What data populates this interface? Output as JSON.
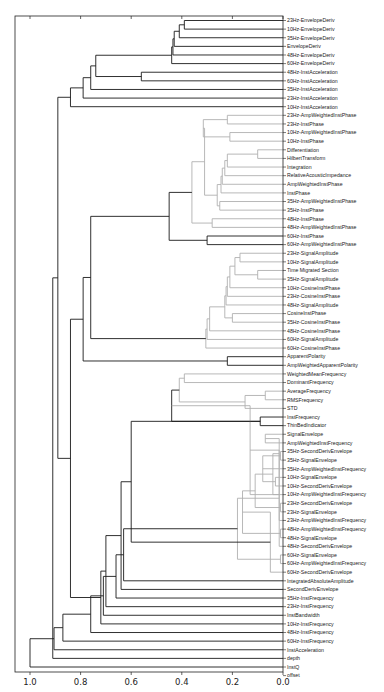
{
  "chart_data": {
    "type": "dendrogram",
    "orientation": "left",
    "title": "",
    "xlabel": "",
    "ylabel": "",
    "xlim": [
      1.05,
      0.0
    ],
    "x_ticks": [
      "1.0",
      "0.8",
      "0.6",
      "0.4",
      "0.2",
      "0.0"
    ],
    "x_tick_values": [
      1.0,
      0.8,
      0.6,
      0.4,
      0.2,
      0.0
    ],
    "colors": {
      "primary": "#1a1a1a",
      "secondary": "#b0b0b0"
    },
    "leaves": [
      "23Hz-EnvelopeDeriv",
      "10Hz-EnvelopeDeriv",
      "35Hz-EnvelopeDeriv",
      "EnvelopeDeriv",
      "48Hz-EnvelopeDeriv",
      "60Hz-EnvelopeDeriv",
      "48Hz-InstAcceleration",
      "60Hz-InstAcceleration",
      "35Hz-InstAcceleration",
      "23Hz-InstAcceleration",
      "10Hz-InstAcceleration",
      "23Hz-AmpWeightedInstPhase",
      "23Hz-InstPhase",
      "10Hz-AmpWeightedInstPhase",
      "10Hz-InstPhase",
      "Differentiation",
      "HilbertTransform",
      "Integration",
      "RelativeAcousticImpedance",
      "AmpWeightedInstPhase",
      "InstPhase",
      "35Hz-AmpWeightedInstPhase",
      "35Hz-InstPhase",
      "48Hz-InstPhase",
      "48Hz-AmpWeightedInstPhase",
      "60Hz-InstPhase",
      "60Hz-AmpWeightedInstPhase",
      "23Hz-SignalAmplitude",
      "10Hz-SignalAmplitude",
      "Time Migrated Section",
      "35Hz-SignalAmplitude",
      "10Hz-CosineInstPhase",
      "23Hz-CosineInstPhase",
      "48Hz-SignalAmplitude",
      "CosineInstPhase",
      "35Hz-CosineInstPhase",
      "48Hz-CosineInstPhase",
      "60Hz-SignalAmplitude",
      "60Hz-CosineInstPhase",
      "ApparentPolarity",
      "AmpWeightedApparentPolarity",
      "WeightedMeanFrequency",
      "DominantFrequency",
      "AverageFrequency",
      "RMSFrequency",
      "STD",
      "InstFrequency",
      "ThinBedIndicator",
      "SignalEnvelope",
      "AmpWeightedInstFrequency",
      "35Hz-SecondDerivEnvelope",
      "35Hz-SignalEnvelope",
      "35Hz-AmpWeightedInstFrequency",
      "10Hz-SignalEnvelope",
      "10Hz-SecondDerivEnvelope",
      "10Hz-AmpWeightedInstFrequency",
      "23Hz-SecondDerivEnvelope",
      "23Hz-SignalEnvelope",
      "23Hz-AmpWeightedInstFrequency",
      "48Hz-AmpWeightedInstFrequency",
      "48Hz-SignalEnvelope",
      "48Hz-SecondDerivEnvelope",
      "60Hz-SignalEnvelope",
      "60Hz-AmpWeightedInstFrequency",
      "60Hz-SecondDerivEnvelope",
      "IntegratedAbsoluteAmplitude",
      "SecondDerivEnvelope",
      "35Hz-InstFrequency",
      "23Hz-InstFrequency",
      "InstBandwidth",
      "10Hz-InstFrequency",
      "48Hz-InstFrequency",
      "60Hz-InstFrequency",
      "InstAcceleration",
      "depth",
      "InstQ",
      "offset"
    ],
    "merges": [
      {
        "a": "L0",
        "b": "L1",
        "h": 0.39,
        "c": 0
      },
      {
        "a": "M0",
        "b": "L2",
        "h": 0.41,
        "c": 0
      },
      {
        "a": "M1",
        "b": "L3",
        "h": 0.43,
        "c": 0
      },
      {
        "a": "M2",
        "b": "L4",
        "h": 0.435,
        "c": 0
      },
      {
        "a": "M3",
        "b": "L5",
        "h": 0.44,
        "c": 0
      },
      {
        "a": "L6",
        "b": "L7",
        "h": 0.56,
        "c": 0
      },
      {
        "a": "M4",
        "b": "M5",
        "h": 0.74,
        "c": 0
      },
      {
        "a": "M6",
        "b": "L8",
        "h": 0.76,
        "c": 0
      },
      {
        "a": "M7",
        "b": "L9",
        "h": 0.79,
        "c": 0
      },
      {
        "a": "M8",
        "b": "L10",
        "h": 0.84,
        "c": 0
      },
      {
        "a": "L11",
        "b": "L12",
        "h": 0.22,
        "c": 1
      },
      {
        "a": "L13",
        "b": "L14",
        "h": 0.21,
        "c": 1
      },
      {
        "a": "M10",
        "b": "M11",
        "h": 0.315,
        "c": 1
      },
      {
        "a": "L15",
        "b": "L16",
        "h": 0.1,
        "c": 1
      },
      {
        "a": "M13",
        "b": "L17",
        "h": 0.22,
        "c": 1
      },
      {
        "a": "M14",
        "b": "L18",
        "h": 0.23,
        "c": 1
      },
      {
        "a": "M15",
        "b": "L19",
        "h": 0.24,
        "c": 1
      },
      {
        "a": "M16",
        "b": "L20",
        "h": 0.245,
        "c": 1
      },
      {
        "a": "L21",
        "b": "L22",
        "h": 0.25,
        "c": 1
      },
      {
        "a": "M17",
        "b": "M18",
        "h": 0.26,
        "c": 1
      },
      {
        "a": "M12",
        "b": "M19",
        "h": 0.31,
        "c": 1
      },
      {
        "a": "L23",
        "b": "L24",
        "h": 0.28,
        "c": 1
      },
      {
        "a": "M20",
        "b": "M21",
        "h": 0.36,
        "c": 1
      },
      {
        "a": "L25",
        "b": "L26",
        "h": 0.3,
        "c": 0
      },
      {
        "a": "M22",
        "b": "M23",
        "h": 0.45,
        "c": 0
      },
      {
        "a": "L27",
        "b": "L28",
        "h": 0.17,
        "c": 1
      },
      {
        "a": "L29",
        "b": "L30",
        "h": 0.1,
        "c": 1
      },
      {
        "a": "M25",
        "b": "M26",
        "h": 0.19,
        "c": 1
      },
      {
        "a": "M27",
        "b": "L31",
        "h": 0.21,
        "c": 1
      },
      {
        "a": "M28",
        "b": "L32",
        "h": 0.22,
        "c": 1
      },
      {
        "a": "M29",
        "b": "L33",
        "h": 0.225,
        "c": 1
      },
      {
        "a": "L34",
        "b": "L35",
        "h": 0.2,
        "c": 1
      },
      {
        "a": "M30",
        "b": "M31",
        "h": 0.23,
        "c": 1
      },
      {
        "a": "M32",
        "b": "L36",
        "h": 0.29,
        "c": 1
      },
      {
        "a": "M33",
        "b": "L37",
        "h": 0.3,
        "c": 1
      },
      {
        "a": "M34",
        "b": "L38",
        "h": 0.305,
        "c": 1
      },
      {
        "a": "M24",
        "b": "M35",
        "h": 0.76,
        "c": 0
      },
      {
        "a": "L39",
        "b": "L40",
        "h": 0.22,
        "c": 0
      },
      {
        "a": "M36",
        "b": "M37",
        "h": 0.79,
        "c": 0
      },
      {
        "a": "L41",
        "b": "L42",
        "h": 0.39,
        "c": 1
      },
      {
        "a": "L43",
        "b": "L44",
        "h": 0.07,
        "c": 1
      },
      {
        "a": "M40",
        "b": "L45",
        "h": 0.15,
        "c": 1
      },
      {
        "a": "M39",
        "b": "M41",
        "h": 0.41,
        "c": 1
      },
      {
        "a": "L46",
        "b": "L47",
        "h": 0.09,
        "c": 0
      },
      {
        "a": "M42",
        "b": "M43",
        "h": 0.44,
        "c": 0
      },
      {
        "a": "L48",
        "b": "L49",
        "h": 0.07,
        "c": 1
      },
      {
        "a": "L50",
        "b": "L51",
        "h": 0.01,
        "c": 1
      },
      {
        "a": "M45",
        "b": "L52",
        "h": 0.015,
        "c": 1
      },
      {
        "a": "L53",
        "b": "L54",
        "h": 0.03,
        "c": 1
      },
      {
        "a": "M47",
        "b": "L55",
        "h": 0.04,
        "c": 1
      },
      {
        "a": "M46",
        "b": "M48",
        "h": 0.08,
        "c": 1
      },
      {
        "a": "L56",
        "b": "L57",
        "h": 0.01,
        "c": 1
      },
      {
        "a": "M50",
        "b": "L58",
        "h": 0.015,
        "c": 1
      },
      {
        "a": "M49",
        "b": "M51",
        "h": 0.11,
        "c": 1
      },
      {
        "a": "M44",
        "b": "M52",
        "h": 0.13,
        "c": 1
      },
      {
        "a": "L59",
        "b": "L60",
        "h": 0.01,
        "c": 1
      },
      {
        "a": "M54",
        "b": "L61",
        "h": 0.015,
        "c": 1
      },
      {
        "a": "M53",
        "b": "M55",
        "h": 0.16,
        "c": 1
      },
      {
        "a": "L62",
        "b": "L63",
        "h": 0.01,
        "c": 1
      },
      {
        "a": "M57",
        "b": "L64",
        "h": 0.05,
        "c": 1
      },
      {
        "a": "M56",
        "b": "M58",
        "h": 0.18,
        "c": 1
      },
      {
        "a": "M43b",
        "b": "M59",
        "h": 0.6,
        "c": 0
      },
      {
        "a": "M60",
        "b": "L65",
        "h": 0.63,
        "c": 0
      },
      {
        "a": "M61",
        "b": "L66",
        "h": 0.64,
        "c": 0
      },
      {
        "a": "M62",
        "b": "L67",
        "h": 0.66,
        "c": 0
      },
      {
        "a": "M63",
        "b": "L68",
        "h": 0.7,
        "c": 0
      },
      {
        "a": "M64",
        "b": "L69",
        "h": 0.71,
        "c": 0
      },
      {
        "a": "M65",
        "b": "L70",
        "h": 0.72,
        "c": 0
      },
      {
        "a": "M66",
        "b": "L71",
        "h": 0.76,
        "c": 0
      },
      {
        "a": "M38",
        "b": "M67",
        "h": 0.84,
        "c": 0
      },
      {
        "a": "M68",
        "b": "L72",
        "h": 0.87,
        "c": 0
      },
      {
        "a": "M9",
        "b": "M69",
        "h": 0.89,
        "c": 0
      },
      {
        "a": "M70",
        "b": "L73",
        "h": 0.905,
        "c": 0
      },
      {
        "a": "M71",
        "b": "L74",
        "h": 0.91,
        "c": 0
      },
      {
        "a": "M72",
        "b": "L75",
        "h": 1.0,
        "c": 0
      }
    ]
  }
}
